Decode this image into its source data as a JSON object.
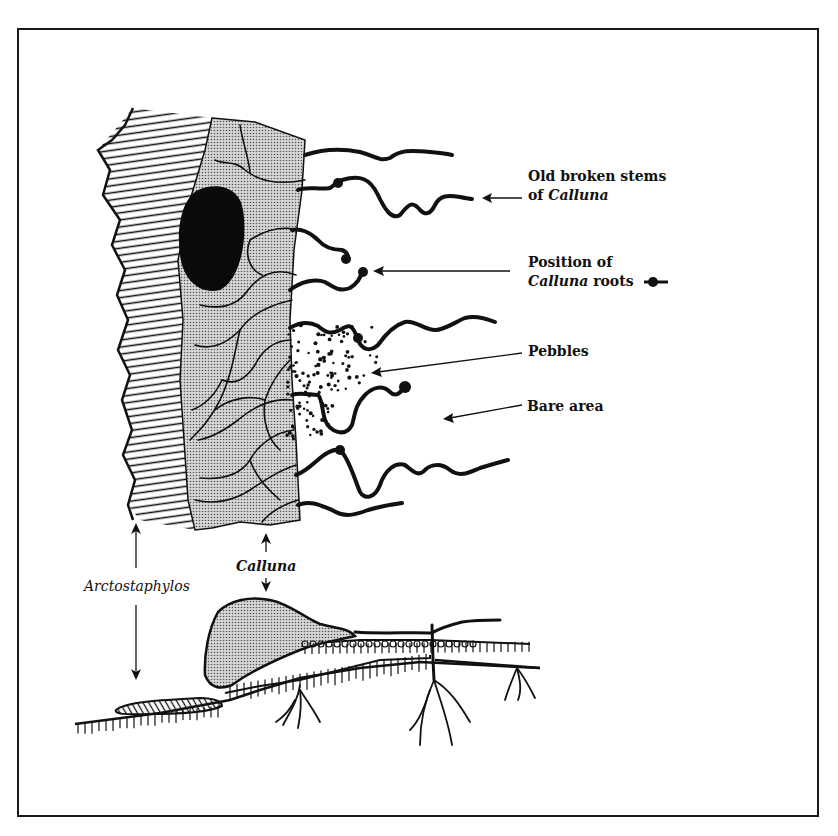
{
  "figure": {
    "type": "botanical-diagram"
  },
  "labels": {
    "old_stems_line1": "Old broken stems",
    "old_stems_line2_prefix": "of ",
    "old_stems_line2_italic": "Calluna",
    "position_line1": "Position of",
    "position_line2_italic": "Calluna",
    "position_line2_suffix": " roots",
    "pebbles": "Pebbles",
    "bare_area": "Bare area",
    "arctostaphylos": "Arctostaphylos",
    "calluna": "Calluna"
  },
  "colors": {
    "ink": "#111111",
    "stipple_fill": "#bdbdbd",
    "paper": "#ffffff"
  }
}
